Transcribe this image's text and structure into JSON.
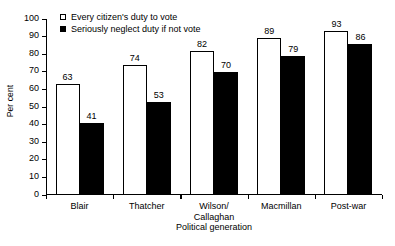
{
  "chart_data": {
    "type": "bar",
    "title": "",
    "xlabel": "Political generation",
    "ylabel": "Per cent",
    "categories": [
      "Blair",
      "Thatcher",
      "Wilson/\nCallaghan",
      "Macmillan",
      "Post-war"
    ],
    "series": [
      {
        "name": "Every citizen's duty to vote",
        "style": "open",
        "color": "#ffffff",
        "values": [
          63,
          74,
          82,
          89,
          93
        ]
      },
      {
        "name": "Seriously neglect duty if not vote",
        "style": "filled",
        "color": "#000000",
        "values": [
          41,
          53,
          70,
          79,
          86
        ]
      }
    ],
    "ylim": [
      0,
      100
    ],
    "yticks": [
      0,
      10,
      20,
      30,
      40,
      50,
      60,
      70,
      80,
      90,
      100
    ],
    "grid": false,
    "legend_position": "top-left"
  },
  "legend": {
    "entries": [
      {
        "label": "Every citizen's duty to vote",
        "marker": "open-square-icon"
      },
      {
        "label": "Seriously neglect duty if not vote",
        "marker": "filled-square-icon"
      }
    ]
  }
}
